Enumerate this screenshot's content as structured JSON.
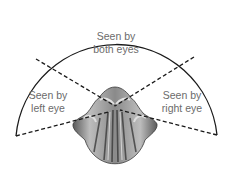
{
  "diagram": {
    "regions": [
      {
        "id": "both",
        "line1": "Seen by",
        "line2": "both eyes"
      },
      {
        "id": "left",
        "line1": "Seen by",
        "line2": "left eye"
      },
      {
        "id": "right",
        "line1": "Seen by",
        "line2": "right eye"
      }
    ],
    "colors": {
      "arc": "#1a1a1a",
      "dashed": "#1a1a1a",
      "text": "#6b6b6b",
      "head_dark": "#3a3a3a",
      "head_light": "#c8c8c8"
    }
  }
}
